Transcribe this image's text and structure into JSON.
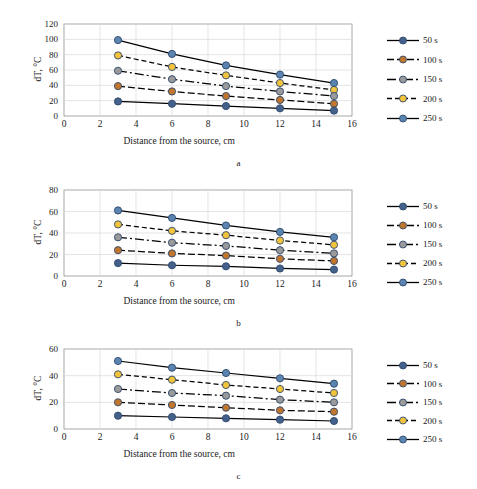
{
  "figure": {
    "subcaptions": [
      "a",
      "b",
      "c"
    ],
    "xlabel": "Distance from the source, cm",
    "ylabel": "dT, °C",
    "legend_labels": [
      "50 s",
      "100 s",
      "150 s",
      "200 s",
      "250 s"
    ],
    "series_colors": [
      "#44618c",
      "#c0762f",
      "#9a9a9a",
      "#f2c33c",
      "#5b84b1"
    ],
    "series_dash": [
      "none",
      "7,3",
      "9,3,2,3",
      "5,3",
      "none"
    ],
    "grid_color": "#d9d9d9",
    "axis_color": "#808080",
    "line_color": "#000000"
  },
  "chart_data": [
    {
      "type": "line",
      "id": "a",
      "title": "",
      "xlabel": "Distance from the source, cm",
      "ylabel": "dT, °C",
      "xlim": [
        0,
        16
      ],
      "ylim": [
        0,
        120
      ],
      "xticks": [
        0,
        2,
        4,
        6,
        8,
        10,
        12,
        14,
        16
      ],
      "yticks": [
        0,
        20,
        40,
        60,
        80,
        100,
        120
      ],
      "grid": true,
      "legend_position": "right",
      "x": [
        3,
        6,
        9,
        12,
        15
      ],
      "series": [
        {
          "name": "50 s",
          "values": [
            19,
            16,
            13,
            10,
            7
          ]
        },
        {
          "name": "100 s",
          "values": [
            39,
            32,
            26,
            21,
            16
          ]
        },
        {
          "name": "150 s",
          "values": [
            59,
            48,
            39,
            32,
            26
          ]
        },
        {
          "name": "200 s",
          "values": [
            79,
            64,
            53,
            43,
            34
          ]
        },
        {
          "name": "250 s",
          "values": [
            99,
            81,
            66,
            54,
            43
          ]
        }
      ]
    },
    {
      "type": "line",
      "id": "b",
      "title": "",
      "xlabel": "Distance from the source, cm",
      "ylabel": "dT, °C",
      "xlim": [
        0,
        16
      ],
      "ylim": [
        0,
        80
      ],
      "xticks": [
        0,
        2,
        4,
        6,
        8,
        10,
        12,
        14,
        16
      ],
      "yticks": [
        0,
        20,
        40,
        60,
        80
      ],
      "grid": true,
      "legend_position": "right",
      "x": [
        3,
        6,
        9,
        12,
        15
      ],
      "series": [
        {
          "name": "50 s",
          "values": [
            12,
            10,
            9,
            7,
            6
          ]
        },
        {
          "name": "100 s",
          "values": [
            24,
            21,
            19,
            16,
            14
          ]
        },
        {
          "name": "150 s",
          "values": [
            36,
            31,
            28,
            24,
            21
          ]
        },
        {
          "name": "200 s",
          "values": [
            48,
            42,
            38,
            33,
            29
          ]
        },
        {
          "name": "250 s",
          "values": [
            61,
            54,
            47,
            41,
            36
          ]
        }
      ]
    },
    {
      "type": "line",
      "id": "c",
      "title": "",
      "xlabel": "Distance from the source, cm",
      "ylabel": "dT, °C",
      "xlim": [
        0,
        16
      ],
      "ylim": [
        0,
        60
      ],
      "xticks": [
        0,
        2,
        4,
        6,
        8,
        10,
        12,
        14,
        16
      ],
      "yticks": [
        0,
        20,
        40,
        60
      ],
      "grid": true,
      "legend_position": "right",
      "x": [
        3,
        6,
        9,
        12,
        15
      ],
      "series": [
        {
          "name": "50 s",
          "values": [
            10,
            9,
            8,
            7,
            6
          ]
        },
        {
          "name": "100 s",
          "values": [
            20,
            18,
            16,
            14,
            13
          ]
        },
        {
          "name": "150 s",
          "values": [
            30,
            27,
            25,
            22,
            20
          ]
        },
        {
          "name": "200 s",
          "values": [
            41,
            37,
            33,
            30,
            27
          ]
        },
        {
          "name": "250 s",
          "values": [
            51,
            46,
            42,
            38,
            34
          ]
        }
      ]
    }
  ]
}
